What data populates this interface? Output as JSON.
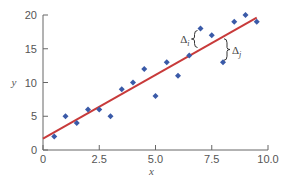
{
  "chart_data": {
    "type": "scatter",
    "title": "",
    "xlabel": "x",
    "ylabel": "y",
    "xlim": [
      0,
      10
    ],
    "ylim": [
      0,
      20
    ],
    "grid": false,
    "legend": null,
    "x_ticks": [
      0,
      2.5,
      5.0,
      7.5,
      10.0
    ],
    "x_tick_labels": [
      "0",
      "2.5",
      "5.0",
      "7.5",
      "10.0"
    ],
    "y_ticks": [
      0,
      5,
      10,
      15,
      20
    ],
    "y_tick_labels": [
      "0",
      "5",
      "10",
      "15",
      "20"
    ],
    "series": [
      {
        "name": "data points",
        "kind": "scatter",
        "marker": "diamond",
        "color": "#3a5aa8",
        "x": [
          0.5,
          1.0,
          1.5,
          2.0,
          2.5,
          3.0,
          3.5,
          4.0,
          4.5,
          5.0,
          5.5,
          6.0,
          6.5,
          7.0,
          7.5,
          8.0,
          8.5,
          9.0,
          9.5
        ],
        "y": [
          2,
          5,
          4,
          6,
          6,
          5,
          9,
          10,
          12,
          8,
          13,
          11,
          14,
          18,
          17,
          13,
          19,
          20,
          19
        ]
      },
      {
        "name": "regression line",
        "kind": "line",
        "color": "#c83a3a",
        "x": [
          0,
          9.5
        ],
        "y": [
          1.7,
          19.6
        ]
      }
    ],
    "annotations": [
      {
        "label": "Δ",
        "subscript": "i",
        "point_x": 7.0,
        "point_y": 18,
        "side": "above-line"
      },
      {
        "label": "Δ",
        "subscript": "j",
        "point_x": 8.0,
        "point_y": 13,
        "side": "below-line"
      }
    ]
  }
}
